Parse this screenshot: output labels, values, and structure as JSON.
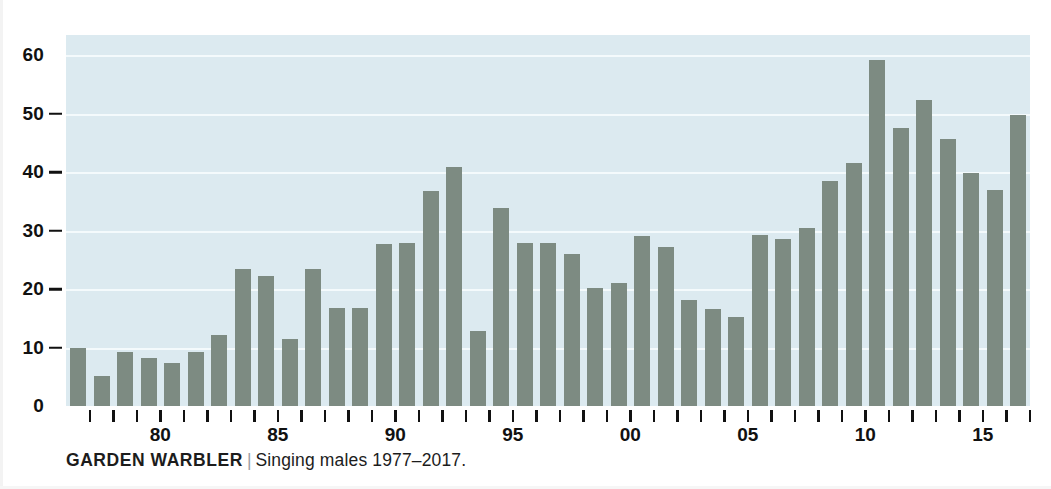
{
  "chart_data": {
    "type": "bar",
    "title": "GARDEN WARBLER",
    "subtitle": "Singing males 1977–2017.",
    "separator": "|",
    "xlabel": "",
    "ylabel": "",
    "ylim": [
      0,
      62
    ],
    "grid": true,
    "legend": null,
    "categories": [
      "1977",
      "1978",
      "1979",
      "1980",
      "1981",
      "1982",
      "1983",
      "1984",
      "1985",
      "1986",
      "1987",
      "1988",
      "1989",
      "1990",
      "1991",
      "1992",
      "1993",
      "1994",
      "1995",
      "1996",
      "1997",
      "1998",
      "1999",
      "2000",
      "2001",
      "2002",
      "2003",
      "2004",
      "2005",
      "2006",
      "2007",
      "2008",
      "2009",
      "2010",
      "2011",
      "2012",
      "2013",
      "2014",
      "2015",
      "2016",
      "2017"
    ],
    "values": [
      10.0,
      5.2,
      9.2,
      8.2,
      7.3,
      9.3,
      12.2,
      23.4,
      22.3,
      11.5,
      23.5,
      16.7,
      16.7,
      27.7,
      27.8,
      36.8,
      40.8,
      12.8,
      33.9,
      27.9,
      27.9,
      26.0,
      20.2,
      21.1,
      29.1,
      27.1,
      18.2,
      16.5,
      15.3,
      29.3,
      28.5,
      30.5,
      38.4,
      41.5,
      59.2,
      47.6,
      52.3,
      45.6,
      39.8,
      36.9,
      49.8
    ],
    "y_ticks": [
      {
        "value": 0,
        "label": "0"
      },
      {
        "value": 10,
        "label": "10"
      },
      {
        "value": 20,
        "label": "20"
      },
      {
        "value": 30,
        "label": "30"
      },
      {
        "value": 40,
        "label": "40"
      },
      {
        "value": 50,
        "label": "50"
      },
      {
        "value": 60,
        "label": "60"
      }
    ],
    "x_ticks": [
      {
        "index": 3,
        "label": "80"
      },
      {
        "index": 8,
        "label": "85"
      },
      {
        "index": 13,
        "label": "90"
      },
      {
        "index": 18,
        "label": "95"
      },
      {
        "index": 23,
        "label": "00"
      },
      {
        "index": 28,
        "label": "05"
      },
      {
        "index": 33,
        "label": "10"
      },
      {
        "index": 38,
        "label": "15"
      }
    ],
    "colors": {
      "bar": "#7d8b82",
      "plot_background": "#dceaf0",
      "gridline": "#f4fafc",
      "axis_text": "#111111",
      "page_background": "#ffffff",
      "caption_separator": "#9aa0a3"
    }
  }
}
